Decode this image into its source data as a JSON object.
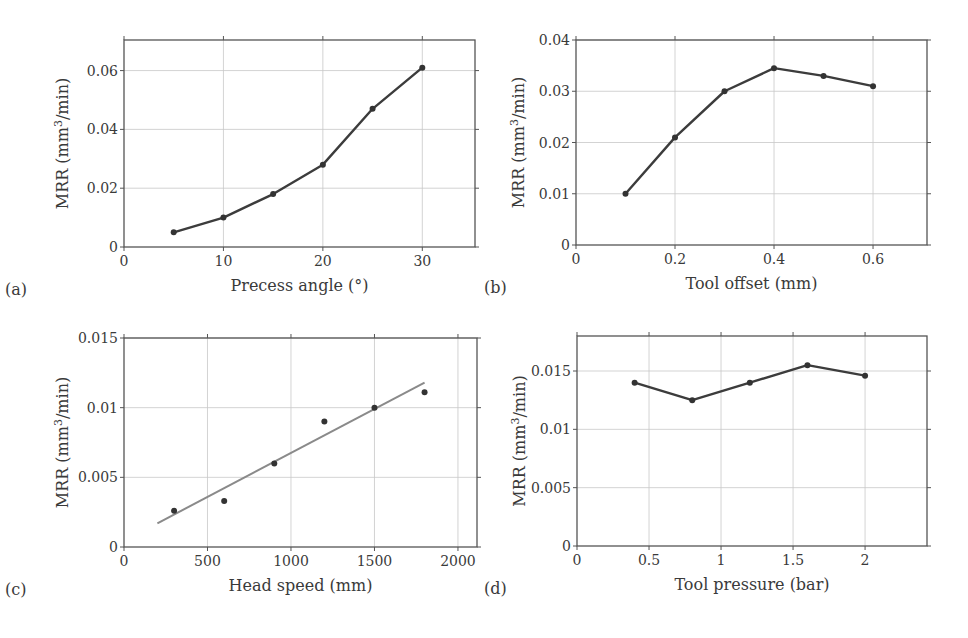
{
  "figure": {
    "width": 968,
    "height": 638
  },
  "chart_data": [
    {
      "id": "a",
      "panel_label": "(a)",
      "type": "line",
      "title": "",
      "xlabel": "Precess angle (°)",
      "ylabel": "MRR (mm3/min)",
      "ylabel_parts": {
        "pre": "MRR (mm",
        "sup": "3",
        "post": "/min)"
      },
      "x": [
        5,
        10,
        15,
        20,
        25,
        30
      ],
      "series": [
        {
          "name": "MRR",
          "values": [
            0.005,
            0.01,
            0.018,
            0.028,
            0.047,
            0.061
          ]
        }
      ],
      "xlim": [
        0,
        35.3
      ],
      "ylim": [
        0,
        0.0704
      ],
      "xticks": [
        0,
        10,
        20,
        30
      ],
      "xtick_labels": [
        "0",
        "10",
        "20",
        "30"
      ],
      "yticks": [
        0,
        0.02,
        0.04,
        0.06
      ],
      "ytick_labels": [
        "0",
        "0.02",
        "0.04",
        "0.06"
      ],
      "grid": true,
      "markers": true,
      "box": {
        "left": 124,
        "top": 40,
        "right": 475,
        "bottom": 247
      }
    },
    {
      "id": "b",
      "panel_label": "(b)",
      "type": "line",
      "title": "",
      "xlabel": "Tool offset (mm)",
      "ylabel": "MRR (mm3/min)",
      "ylabel_parts": {
        "pre": "MRR (mm",
        "sup": "3",
        "post": "/min)"
      },
      "x": [
        0.1,
        0.2,
        0.3,
        0.4,
        0.5,
        0.6
      ],
      "series": [
        {
          "name": "MRR",
          "values": [
            0.01,
            0.021,
            0.03,
            0.0345,
            0.033,
            0.031
          ]
        }
      ],
      "xlim": [
        0,
        0.709
      ],
      "ylim": [
        0,
        0.04
      ],
      "xticks": [
        0,
        0.2,
        0.4,
        0.6
      ],
      "xtick_labels": [
        "0",
        "0.2",
        "0.4",
        "0.6"
      ],
      "yticks": [
        0,
        0.01,
        0.02,
        0.03,
        0.04
      ],
      "ytick_labels": [
        "0",
        "0.01",
        "0.02",
        "0.03",
        "0.04"
      ],
      "grid": true,
      "markers": true,
      "box": {
        "left": 576,
        "top": 40,
        "right": 927,
        "bottom": 245
      }
    },
    {
      "id": "c",
      "panel_label": "(c)",
      "type": "scatter",
      "title": "",
      "xlabel": "Head speed (mm)",
      "ylabel": "MRR (mm3/min)",
      "ylabel_parts": {
        "pre": "MRR (mm",
        "sup": "3",
        "post": "/min)"
      },
      "x": [
        300,
        600,
        900,
        1200,
        1500,
        1800
      ],
      "series": [
        {
          "name": "MRR",
          "values": [
            0.0026,
            0.0033,
            0.006,
            0.009,
            0.01,
            0.0111
          ]
        },
        {
          "name": "Linear fit",
          "x": [
            200,
            1800
          ],
          "values": [
            0.0017,
            0.0118
          ]
        }
      ],
      "xlim": [
        0,
        2114
      ],
      "ylim": [
        0,
        0.015
      ],
      "xticks": [
        0,
        500,
        1000,
        1500,
        2000
      ],
      "xtick_labels": [
        "0",
        "500",
        "1000",
        "1500",
        "2000"
      ],
      "yticks": [
        0,
        0.005,
        0.01,
        0.015
      ],
      "ytick_labels": [
        "0",
        "0.005",
        "0.01",
        "0.015"
      ],
      "grid": true,
      "markers": true,
      "box": {
        "left": 124,
        "top": 338,
        "right": 477,
        "bottom": 547
      }
    },
    {
      "id": "d",
      "panel_label": "(d)",
      "type": "line",
      "title": "",
      "xlabel": "Tool pressure (bar)",
      "ylabel": "MRR (mm3/min)",
      "ylabel_parts": {
        "pre": "MRR (mm",
        "sup": "3",
        "post": "/min)"
      },
      "x": [
        0.4,
        0.8,
        1.2,
        1.6,
        2.0
      ],
      "series": [
        {
          "name": "MRR",
          "values": [
            0.014,
            0.0125,
            0.014,
            0.0155,
            0.0146
          ]
        }
      ],
      "xlim": [
        0,
        2.43
      ],
      "ylim": [
        0,
        0.018
      ],
      "xticks": [
        0,
        0.5,
        1,
        1.5,
        2
      ],
      "xtick_labels": [
        "0",
        "0.5",
        "1",
        "1.5",
        "2"
      ],
      "yticks": [
        0,
        0.005,
        0.01,
        0.015
      ],
      "ytick_labels": [
        "0",
        "0.005",
        "0.01",
        "0.015"
      ],
      "grid": true,
      "markers": true,
      "box": {
        "left": 577,
        "top": 336,
        "right": 927,
        "bottom": 546
      }
    }
  ]
}
